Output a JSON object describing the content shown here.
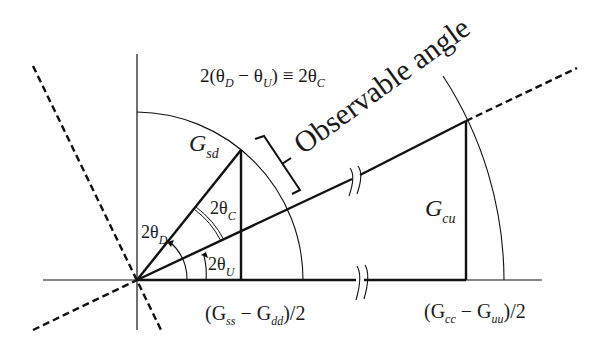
{
  "diagram": {
    "title": "Observable angle",
    "equation": {
      "prefix": "2(θ",
      "sub_d": "D",
      "minus": " − θ",
      "sub_u": "U",
      "suffix": ") ≡ 2θ",
      "sub_c": "C"
    },
    "labels": {
      "gsd_main": "G",
      "gsd_sub": "sd",
      "gcu_main": "G",
      "gcu_sub": "cu",
      "theta_d_main": "2θ",
      "theta_d_sub": "D",
      "theta_c_main": "2θ",
      "theta_c_sub": "C",
      "theta_u_main": "2θ",
      "theta_u_sub": "U",
      "axis_left": {
        "open": "(G",
        "sub1": "ss",
        "mid": " − G",
        "sub2": "dd",
        "close": ")/2"
      },
      "axis_right": {
        "open": "(G",
        "sub1": "cc",
        "mid": " − G",
        "sub2": "uu",
        "close": ")/2"
      }
    },
    "colors": {
      "line": "#111111",
      "background": "#ffffff"
    }
  }
}
